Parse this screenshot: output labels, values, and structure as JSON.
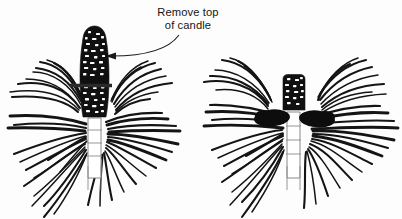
{
  "diagram": {
    "background_color": "#fdfdfd",
    "ink_color": "#141414",
    "callout": {
      "line1": "Remove top",
      "line2": "of candle",
      "arrow_name": "callout-arrow",
      "arrow_points_to": "candle cut line on left figure"
    },
    "figures": [
      {
        "id": "before",
        "label": "Left figure: pine shoot with full candle and cut line",
        "candle": {
          "name": "pine-candle",
          "state": "uncut",
          "texture": "scaly dark with light flecks"
        },
        "cut_line": {
          "name": "cut-line",
          "description": "horizontal bar marking where to remove the candle top"
        },
        "stem": {
          "name": "pine-stem",
          "segments": 3
        },
        "needle_count": 46
      },
      {
        "id": "after",
        "label": "Right figure: pine shoot after candle top removed",
        "candle": {
          "name": "pine-candle-stub",
          "state": "cut",
          "texture": "short dark stub"
        },
        "side_buds": {
          "name": "side-bud",
          "count": 2,
          "description": "two dark lateral buds flanking the stem"
        },
        "stem": {
          "name": "pine-stem",
          "segments": 3
        },
        "needle_count": 48
      }
    ]
  }
}
